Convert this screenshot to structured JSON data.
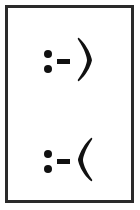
{
  "page": {
    "background_color": "#ffffff",
    "width": 140,
    "height": 210
  },
  "frame": {
    "border_color": "#2a2a2a",
    "border_width": 3,
    "fill_color": "#ffffff"
  },
  "ink_color": "#111111",
  "emoticons": [
    {
      "id": "smiley",
      "text": ":-)",
      "meaning": "smiley face",
      "eyes": ":",
      "nose": "-",
      "mouth": ")",
      "position": "top"
    },
    {
      "id": "frowny",
      "text": ":-(",
      "meaning": "frowning face",
      "eyes": ":",
      "nose": "-",
      "mouth": "(",
      "position": "bottom"
    }
  ]
}
